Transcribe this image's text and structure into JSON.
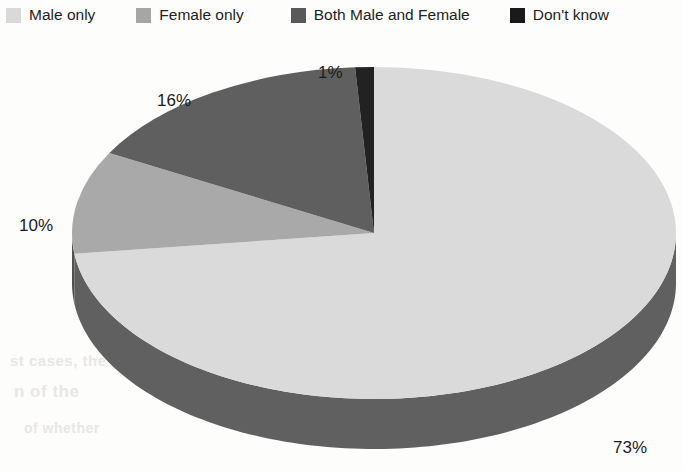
{
  "legend": {
    "items": [
      {
        "label": "Male only",
        "color": "#d9d9d9",
        "swatch_name": "legend-swatch-male-only"
      },
      {
        "label": "Female only",
        "color": "#a6a6a6",
        "swatch_name": "legend-swatch-female-only"
      },
      {
        "label": "Both Male and Female",
        "color": "#595959",
        "swatch_name": "legend-swatch-both-male-and-female"
      },
      {
        "label": "Don't know",
        "color": "#1a1a1a",
        "swatch_name": "legend-swatch-dont-know"
      }
    ]
  },
  "labels": {
    "male_only": "73%",
    "both": "16%",
    "female_only": "10%",
    "dont_know": "1%"
  },
  "ghost_text": {
    "a": "to kill or harm",
    "b": "st cases, the",
    "c": "n of the",
    "d": "of whether",
    "e": "a n d   t h e"
  },
  "chart_data": {
    "type": "pie",
    "title": "",
    "three_d": true,
    "start_angle": 0,
    "direction": "clockwise",
    "categories": [
      "Male only",
      "Female only",
      "Both Male and Female",
      "Don't know"
    ],
    "values": [
      73,
      10,
      16,
      1
    ],
    "value_unit": "%",
    "data_labels": [
      "73%",
      "10%",
      "16%",
      "1%"
    ],
    "colors": [
      "#d9d9d9",
      "#a6a6a6",
      "#595959",
      "#1a1a1a"
    ],
    "side_colors": [
      "#5a5a5a",
      "#4a4a4a",
      "#3f3f3f",
      "#151515"
    ],
    "legend_position": "top",
    "grid": false,
    "slice_order_clockwise_from_12": [
      {
        "category": "Male only",
        "value": 73,
        "label": "73%"
      },
      {
        "category": "Female only",
        "value": 10,
        "label": "10%"
      },
      {
        "category": "Both Male and Female",
        "value": 16,
        "label": "16%"
      },
      {
        "category": "Don't know",
        "value": 1,
        "label": "1%"
      }
    ]
  }
}
